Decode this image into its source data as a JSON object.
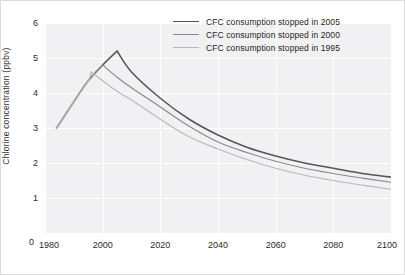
{
  "chart_data": {
    "type": "line",
    "title": "",
    "subtitle": "",
    "xlabel": "",
    "ylabel": "Chlorine concentration (ppbv)",
    "xlim": [
      1980,
      2100
    ],
    "ylim": [
      0,
      6
    ],
    "xticks": [
      "1980",
      "2000",
      "2020",
      "2040",
      "2060",
      "2080",
      "2100"
    ],
    "xtick_values": [
      1980,
      2000,
      2020,
      2040,
      2060,
      2080,
      2100
    ],
    "yticks": [
      "0",
      "1",
      "2",
      "3",
      "4",
      "5",
      "6"
    ],
    "ytick_values": [
      0,
      1,
      2,
      3,
      4,
      5,
      6
    ],
    "grid": true,
    "grid_color": "#ffffff",
    "plot_background": "#f1f1f3",
    "legend_position": "top-right",
    "series": [
      {
        "name": "CFC consumption stopped in 2005",
        "color": "#555555",
        "peak_year": 2005,
        "peak_value": 5.2,
        "x": [
          1984,
          1990,
          1995,
          2000,
          2005,
          2010,
          2020,
          2030,
          2040,
          2050,
          2060,
          2070,
          2080,
          2090,
          2100
        ],
        "values": [
          3.0,
          3.75,
          4.35,
          4.8,
          5.2,
          4.6,
          3.85,
          3.25,
          2.8,
          2.45,
          2.2,
          2.0,
          1.85,
          1.7,
          1.6
        ]
      },
      {
        "name": "CFC consumption stopped in 2000",
        "color": "#8a8a8a",
        "peak_year": 2000,
        "peak_value": 4.8,
        "x": [
          1984,
          1990,
          1995,
          2000,
          2005,
          2010,
          2020,
          2030,
          2040,
          2050,
          2060,
          2070,
          2080,
          2090,
          2100
        ],
        "values": [
          3.0,
          3.75,
          4.35,
          4.8,
          4.45,
          4.15,
          3.6,
          3.05,
          2.6,
          2.3,
          2.05,
          1.85,
          1.7,
          1.57,
          1.45
        ]
      },
      {
        "name": "CFC consumption stopped in 1995",
        "color": "#b9b9b9",
        "peak_year": 1996,
        "peak_value": 4.6,
        "x": [
          1984,
          1990,
          1995,
          2000,
          2005,
          2010,
          2020,
          2030,
          2040,
          2050,
          2060,
          2070,
          2080,
          2090,
          2100
        ],
        "values": [
          3.0,
          3.75,
          4.35,
          4.35,
          4.05,
          3.8,
          3.25,
          2.75,
          2.4,
          2.1,
          1.85,
          1.65,
          1.5,
          1.37,
          1.25
        ]
      }
    ]
  },
  "legend": {
    "items": [
      {
        "label": "CFC consumption stopped in 2005",
        "color": "#555555",
        "width": 1.6
      },
      {
        "label": "CFC consumption stopped in 2000",
        "color": "#8a8a8a",
        "width": 1.2
      },
      {
        "label": "CFC consumption stopped in 1995",
        "color": "#b9b9b9",
        "width": 1.2
      }
    ]
  },
  "axis": {
    "y_zero_label": "0",
    "y_title": "Chlorine concentration (ppbv)"
  }
}
